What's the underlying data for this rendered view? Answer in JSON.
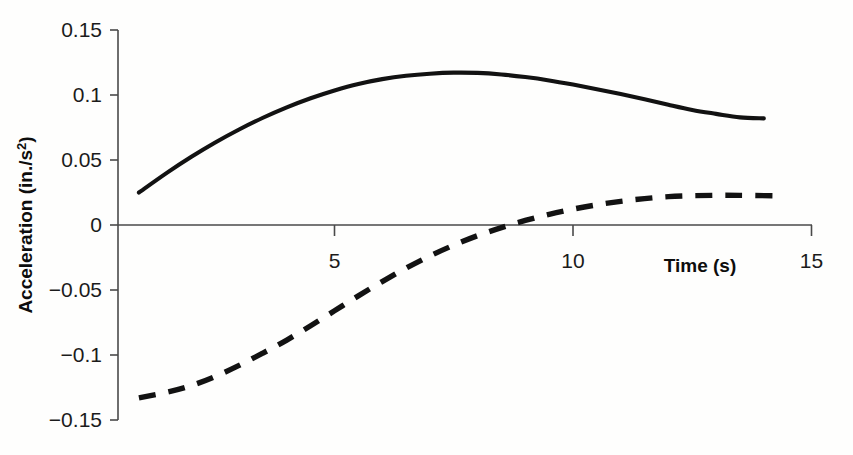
{
  "chart_data": {
    "type": "line",
    "title": "",
    "subtitle": "",
    "xlabel": "Time (s)",
    "ylabel": "Acceleration (in./s²)",
    "xlim": [
      0,
      15
    ],
    "ylim": [
      -0.15,
      0.15
    ],
    "grid": false,
    "legend": "none",
    "xticks": [
      5,
      10,
      15
    ],
    "xtick_labels": [
      "5",
      "10",
      "15"
    ],
    "yticks": [
      0.15,
      0.1,
      0.05,
      0,
      -0.05,
      -0.1,
      -0.15
    ],
    "ytick_labels": [
      "0.15",
      "0.1",
      "0.05",
      "0",
      "−0.05",
      "−0.1",
      "−0.15"
    ],
    "series": [
      {
        "name": "solid-curve",
        "style": "solid",
        "color": "#121212",
        "x": [
          0.9,
          1.5,
          2.0,
          2.5,
          3.0,
          3.5,
          4.0,
          4.5,
          5.0,
          5.5,
          6.0,
          6.5,
          7.0,
          7.5,
          8.0,
          8.5,
          9.0,
          9.5,
          10.0,
          10.5,
          11.0,
          11.5,
          12.0,
          12.5,
          13.0,
          13.5,
          14.0
        ],
        "y": [
          0.025,
          0.0405,
          0.0525,
          0.0635,
          0.0735,
          0.0825,
          0.0905,
          0.0975,
          0.1035,
          0.1085,
          0.1122,
          0.1148,
          0.1164,
          0.1172,
          0.117,
          0.1158,
          0.1138,
          0.1112,
          0.108,
          0.1045,
          0.1008,
          0.0968,
          0.0925,
          0.0885,
          0.0855,
          0.0828,
          0.082
        ]
      },
      {
        "name": "dashed-curve",
        "style": "dashed",
        "color": "#121212",
        "x": [
          0.9,
          1.5,
          2.0,
          2.5,
          3.0,
          3.5,
          4.0,
          4.5,
          5.0,
          5.5,
          6.0,
          6.5,
          7.0,
          7.5,
          8.0,
          8.5,
          9.0,
          9.5,
          10.0,
          10.5,
          11.0,
          11.5,
          12.0,
          12.5,
          13.0,
          13.5,
          14.2
        ],
        "y": [
          -0.133,
          -0.1285,
          -0.1235,
          -0.1165,
          -0.108,
          -0.0985,
          -0.0885,
          -0.0775,
          -0.066,
          -0.0545,
          -0.0435,
          -0.0332,
          -0.0238,
          -0.0155,
          -0.0082,
          -0.002,
          0.0035,
          0.0082,
          0.0122,
          0.0155,
          0.0182,
          0.0203,
          0.0218,
          0.0225,
          0.0228,
          0.0228,
          0.0225
        ]
      }
    ]
  },
  "axis_geometry": {
    "x_pixel_at_t0": 96.0,
    "x_pixels_per_unit": 47.7,
    "y_pixel_at_zero": 225.0,
    "y_pixels_per_unit": 1300.0
  }
}
